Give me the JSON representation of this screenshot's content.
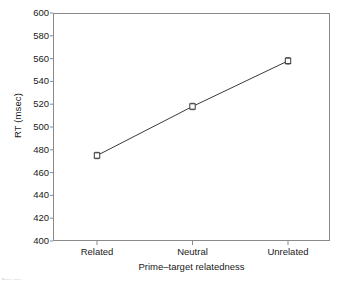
{
  "chart_data": {
    "type": "line",
    "title": "",
    "categories": [
      "Related",
      "Neutral",
      "Unrelated"
    ],
    "values": [
      475,
      518,
      558
    ],
    "series": [
      {
        "name": "RT",
        "values": [
          475,
          518,
          558
        ]
      }
    ],
    "xlabel": "Prime–target relatedness",
    "ylabel": "RT (msec)",
    "ylim": [
      400,
      600
    ],
    "yticks": [
      400,
      420,
      440,
      460,
      480,
      500,
      520,
      540,
      560,
      580,
      600
    ],
    "ytick_labels": [
      "400",
      "420",
      "440",
      "460",
      "480",
      "500",
      "520",
      "540",
      "560",
      "580",
      "600"
    ],
    "grid": false,
    "legend": "none",
    "marker": "open-square",
    "error_bars": true,
    "line_color": "#3a3a3a",
    "marker_edge_color": "#3a3a3a",
    "marker_face_color": "#ffffff",
    "axis_color": "#8a8a8a",
    "background_color": "#ffffff"
  },
  "caption_fragment": "•— —"
}
